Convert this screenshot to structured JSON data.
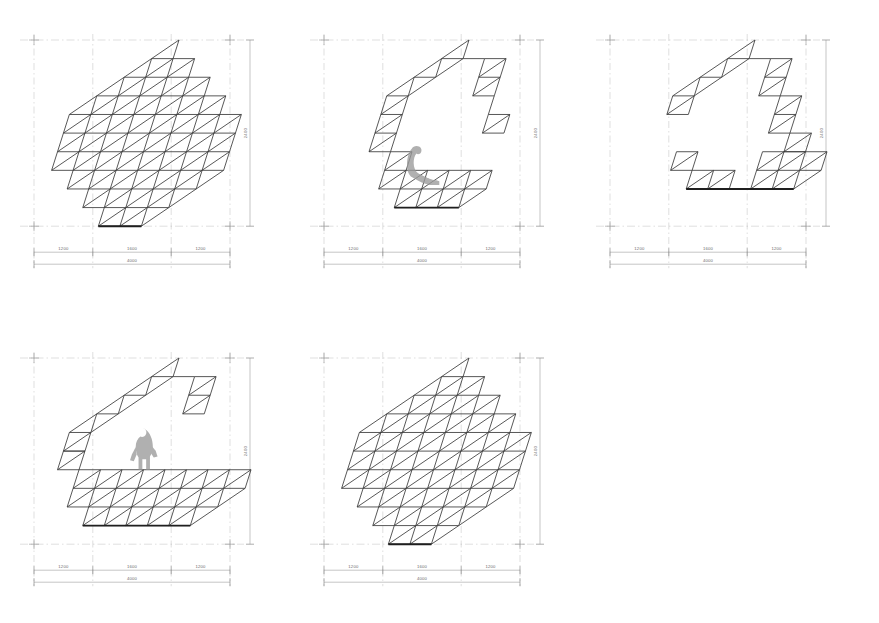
{
  "drawing": {
    "title": "Deployable triangular lattice structure - configuration study",
    "sheet_background": "#ffffff",
    "line_color": "#3a3a3a",
    "thin_line_color": "#777777",
    "dimension_line_color": "#8a8a8a",
    "figure_color": "#9a9a9a",
    "module_edge_mm": 400
  },
  "dimensions": {
    "horizontal_segments": [
      "1200",
      "1600",
      "1200"
    ],
    "horizontal_total": "4000",
    "vertical_total": "2400"
  },
  "panels": [
    {
      "id": "panel-1",
      "name": "configuration-flat-folded",
      "position": {
        "x": 22,
        "y": 34
      },
      "state_label": "folded",
      "has_human_figure": false,
      "figure_pose": "",
      "dims": {
        "segments": [
          "1200",
          "1600",
          "1200"
        ],
        "total": "4000",
        "height": "2400"
      }
    },
    {
      "id": "panel-2",
      "name": "configuration-arch-seat",
      "position": {
        "x": 312,
        "y": 34
      },
      "state_label": "arch with seat",
      "has_human_figure": true,
      "figure_pose": "seated",
      "dims": {
        "segments": [
          "1200",
          "1600",
          "1200"
        ],
        "total": "4000",
        "height": "2400"
      }
    },
    {
      "id": "panel-3",
      "name": "configuration-open-canopy",
      "position": {
        "x": 598,
        "y": 34
      },
      "state_label": "open canopy",
      "has_human_figure": false,
      "figure_pose": "",
      "dims": {
        "segments": [
          "1200",
          "1600",
          "1200"
        ],
        "total": "4000",
        "height": "2400"
      }
    },
    {
      "id": "panel-4",
      "name": "configuration-arch-platform",
      "position": {
        "x": 22,
        "y": 352
      },
      "state_label": "arch with platform",
      "has_human_figure": true,
      "figure_pose": "standing",
      "dims": {
        "segments": [
          "1200",
          "1600",
          "1200"
        ],
        "total": "4000",
        "height": "2400"
      }
    },
    {
      "id": "panel-5",
      "name": "configuration-flat-deployed",
      "position": {
        "x": 312,
        "y": 352
      },
      "state_label": "flat deployed",
      "has_human_figure": false,
      "figure_pose": "",
      "dims": {
        "segments": [
          "1200",
          "1600",
          "1200"
        ],
        "total": "4000",
        "height": "2400"
      }
    }
  ]
}
